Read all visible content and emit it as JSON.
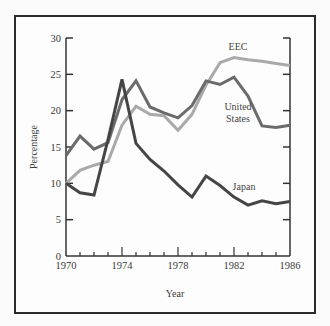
{
  "chart_data": {
    "type": "line",
    "title": "",
    "xlabel": "Year",
    "ylabel": "Percentage",
    "xlim": [
      1970,
      1986
    ],
    "ylim": [
      0,
      30
    ],
    "x_tick_labels": [
      "1970",
      "1974",
      "1978",
      "1982",
      "1986"
    ],
    "y_tick_labels": [
      "0",
      "5",
      "10",
      "15",
      "20",
      "25",
      "30"
    ],
    "grid": false,
    "legend": "inline labels",
    "x": [
      1970,
      1971,
      1972,
      1973,
      1974,
      1975,
      1976,
      1977,
      1978,
      1979,
      1980,
      1981,
      1982,
      1983,
      1984,
      1985,
      1986
    ],
    "series": [
      {
        "name": "EEC",
        "label_lines": [
          "EEC"
        ],
        "color": "#a9a9a9",
        "values": [
          10.0,
          11.8,
          12.5,
          13.0,
          18.0,
          20.6,
          19.5,
          19.3,
          17.3,
          19.5,
          23.5,
          26.6,
          27.3,
          27.0,
          26.8,
          26.5,
          26.2
        ]
      },
      {
        "name": "United States",
        "label_lines": [
          "United",
          "States"
        ],
        "color": "#6b6b6b",
        "values": [
          13.8,
          16.5,
          14.7,
          15.6,
          21.5,
          24.1,
          20.5,
          19.7,
          19.0,
          20.7,
          24.1,
          23.6,
          24.6,
          22.0,
          17.9,
          17.7,
          18.0
        ]
      },
      {
        "name": "Japan",
        "label_lines": [
          "Japan"
        ],
        "color": "#454545",
        "values": [
          10.0,
          8.7,
          8.4,
          16.0,
          24.3,
          15.5,
          13.3,
          11.7,
          9.8,
          8.1,
          11.0,
          9.7,
          8.1,
          7.0,
          7.6,
          7.2,
          7.5
        ]
      }
    ]
  },
  "labels": {
    "xlabel": "Year",
    "ylabel": "Percentage",
    "eec": "EEC",
    "us_line1": "United",
    "us_line2": "States",
    "japan": "Japan"
  }
}
